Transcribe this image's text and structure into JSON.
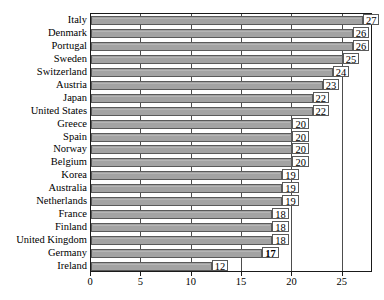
{
  "chart_data": {
    "type": "bar",
    "orientation": "horizontal",
    "title": "",
    "xlabel": "",
    "ylabel": "",
    "xlim": [
      0,
      28
    ],
    "xticks": [
      0,
      5,
      10,
      15,
      20,
      25
    ],
    "xtick_labels": [
      "0",
      "5",
      "10",
      "15",
      "20",
      "25"
    ],
    "grid": true,
    "legend": null,
    "categories": [
      "Italy",
      "Denmark",
      "Portugal",
      "Sweden",
      "Switzerland",
      "Austria",
      "Japan",
      "United States",
      "Greece",
      "Spain",
      "Norway",
      "Belgium",
      "Korea",
      "Australia",
      "Netherlands",
      "France",
      "Finland",
      "United Kingdom",
      "Germany",
      "Ireland"
    ],
    "values": [
      27,
      26,
      26,
      25,
      24,
      23,
      22,
      22,
      20,
      20,
      20,
      20,
      19,
      19,
      19,
      18,
      18,
      18,
      17,
      12
    ],
    "value_labels": [
      "27",
      "26",
      "26",
      "25",
      "24",
      "23",
      "22",
      "22",
      "20",
      "20",
      "20",
      "20",
      "19",
      "19",
      "19",
      "18",
      "18",
      "18",
      "17",
      "12"
    ],
    "highlight_category": "Germany",
    "highlight_value_bold": true,
    "colors": {
      "bar_fill": "#a3a3a3",
      "bar_border": "#5a5a5a",
      "frame": "#1a1a1a",
      "gridline": "#4d4d4d",
      "text": "#000000",
      "background": "#ffffff"
    }
  }
}
